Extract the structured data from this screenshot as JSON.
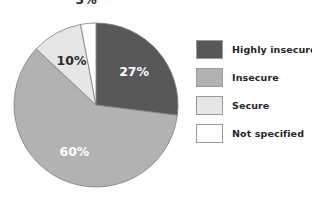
{
  "chart_data": {
    "type": "pie",
    "title": "",
    "labels": [
      "Highly insecure",
      "Insecure",
      "Secure",
      "Not specified"
    ],
    "values": [
      27,
      60,
      10,
      3
    ],
    "value_labels": [
      "27%",
      "60%",
      "10%",
      "3%"
    ],
    "colors": [
      "#58585a",
      "#b2b2b2",
      "#e6e6e6",
      "#ffffff"
    ],
    "label_text_colors": [
      "#ffffff",
      "#ffffff",
      "#2b2b2b",
      "#2b2b2b"
    ],
    "start_angle_deg": 0,
    "direction": "clockwise",
    "legend_position": "right",
    "grid": false
  },
  "legend": {
    "items": [
      {
        "label": "Highly insecure",
        "color": "#58585a"
      },
      {
        "label": "Insecure",
        "color": "#b2b2b2"
      },
      {
        "label": "Secure",
        "color": "#e6e6e6"
      },
      {
        "label": "Not specified",
        "color": "#ffffff"
      }
    ]
  },
  "pie": {
    "slices": [
      {
        "name": "highly-insecure",
        "percent_label": "27%"
      },
      {
        "name": "insecure",
        "percent_label": "60%"
      },
      {
        "name": "secure",
        "percent_label": "10%"
      },
      {
        "name": "not-specified",
        "percent_label": "3%"
      }
    ]
  }
}
